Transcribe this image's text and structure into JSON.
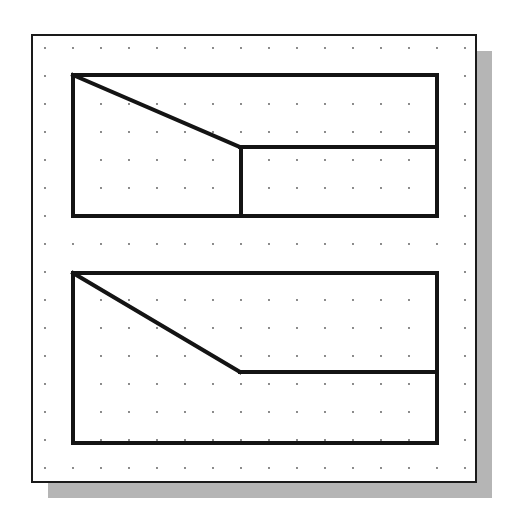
{
  "figure": {
    "colors": {
      "background": "#ffffff",
      "frame": "#1a1a1a",
      "shadow": "#b5b5b5",
      "grid_dot": "#555555",
      "outline": "#141414"
    },
    "frame": {
      "x": 32,
      "y": 35,
      "width": 444,
      "height": 447,
      "stroke": 2
    },
    "shadow": {
      "offset_x": 16,
      "offset_y": 16
    },
    "grid": {
      "origin_x": 45,
      "origin_y": 48,
      "spacing": 28,
      "cols": 16,
      "rows": 16,
      "dot_radius": 0.9
    },
    "shapes": [
      {
        "name": "top-view-with-divider",
        "stroke": 4,
        "rect": {
          "x1": 73,
          "y1": 75,
          "x2": 437,
          "y2": 216
        },
        "lines": [
          {
            "name": "diagonal-edge",
            "x1": 73,
            "y1": 75,
            "x2": 240,
            "y2": 147
          },
          {
            "name": "horizontal-edge",
            "x1": 240,
            "y1": 147,
            "x2": 437,
            "y2": 147
          },
          {
            "name": "vertical-divider",
            "x1": 241,
            "y1": 147,
            "x2": 241,
            "y2": 216
          }
        ]
      },
      {
        "name": "bottom-view",
        "stroke": 4,
        "rect": {
          "x1": 73,
          "y1": 273,
          "x2": 437,
          "y2": 443
        },
        "lines": [
          {
            "name": "diagonal-edge",
            "x1": 73,
            "y1": 273,
            "x2": 240,
            "y2": 372
          },
          {
            "name": "horizontal-edge",
            "x1": 240,
            "y1": 372,
            "x2": 437,
            "y2": 372
          }
        ]
      }
    ]
  }
}
